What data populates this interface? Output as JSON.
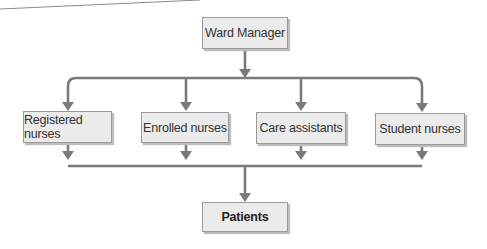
{
  "diagram": {
    "type": "org-chart",
    "top": {
      "label": "Ward Manager"
    },
    "middle": [
      {
        "label": "Registered nurses"
      },
      {
        "label": "Enrolled nurses"
      },
      {
        "label": "Care assistants"
      },
      {
        "label": "Student nurses"
      }
    ],
    "bottom": {
      "label": "Patients"
    },
    "colors": {
      "line": "#7a7a7a",
      "box_fill": "#ebebeb",
      "box_border": "#9a9a9a"
    }
  }
}
